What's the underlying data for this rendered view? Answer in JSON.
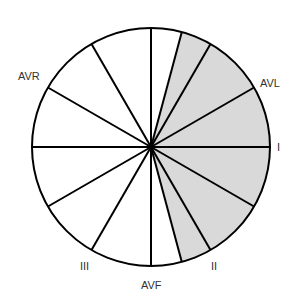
{
  "diagram": {
    "center": [
      151,
      147
    ],
    "radius": 119,
    "colors": {
      "stroke": "#000000",
      "shade": "#d9d9d9",
      "background": "#ffffff",
      "label": "#333333"
    },
    "shaded_sector": {
      "from_deg": -75,
      "to_deg": 75
    },
    "rays_deg": [
      0,
      30,
      60,
      75,
      90,
      120,
      150,
      180,
      210,
      240,
      270,
      285,
      300,
      330
    ],
    "labels": [
      {
        "id": "lead-i",
        "text": "I",
        "x": 277,
        "y": 151
      },
      {
        "id": "lead-avl",
        "text": "AVL",
        "x": 260,
        "y": 87
      },
      {
        "id": "lead-avr",
        "text": "AVR",
        "x": 18,
        "y": 80
      },
      {
        "id": "lead-iii",
        "text": "III",
        "x": 80,
        "y": 270
      },
      {
        "id": "lead-ii",
        "text": "II",
        "x": 211,
        "y": 270
      },
      {
        "id": "lead-avf",
        "text": "AVF",
        "x": 141,
        "y": 289
      }
    ]
  }
}
